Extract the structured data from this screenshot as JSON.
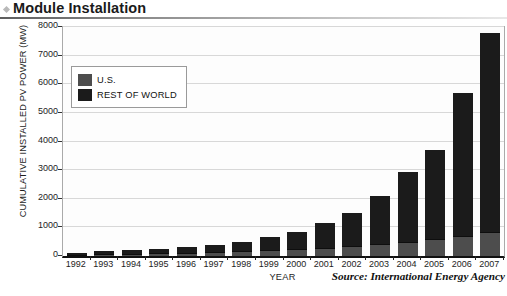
{
  "header": {
    "title": "Module Installation",
    "bullet_icon": "diamond-bullet-icon"
  },
  "chart_data": {
    "type": "bar",
    "subtype": "stacked-bar",
    "title": "Module Installation",
    "xlabel": "YEAR",
    "ylabel": "CUMULATIVE INSTALLED PV POWER (MW)",
    "ylim": [
      0,
      8000
    ],
    "ytick_step": 1000,
    "yticks": [
      0,
      1000,
      2000,
      3000,
      4000,
      5000,
      6000,
      7000,
      8000
    ],
    "ytick_labels": [
      "0",
      "1000",
      "2000",
      "3000",
      "4000",
      "5000",
      "6000",
      "7000",
      "8000"
    ],
    "grid": true,
    "grid_axis": "y",
    "categories": [
      "1992",
      "1993",
      "1994",
      "1995",
      "1996",
      "1997",
      "1998",
      "1999",
      "2000",
      "2001",
      "2002",
      "2003",
      "2004",
      "2005",
      "2006",
      "2007"
    ],
    "legend_position": "upper-left",
    "series": [
      {
        "name": "U.S.",
        "color": "#4d4d4d",
        "values": [
          45,
          60,
          75,
          90,
          110,
          135,
          165,
          200,
          240,
          290,
          350,
          420,
          500,
          590,
          700,
          830
        ]
      },
      {
        "name": "REST OF WORLD",
        "color": "#1b1b1b",
        "values": [
          65,
          100,
          125,
          160,
          210,
          265,
          335,
          450,
          610,
          860,
          1150,
          1680,
          2450,
          3110,
          5000,
          6970
        ]
      }
    ],
    "totals": [
      110,
      160,
      200,
      250,
      320,
      400,
      500,
      650,
      850,
      1150,
      1500,
      2100,
      2950,
      3700,
      5700,
      7800
    ],
    "annotations": {
      "source": "Source: International Energy Agency"
    }
  },
  "legend": {
    "items": [
      {
        "label": "U.S.",
        "swatch": "legend-swatch-us"
      },
      {
        "label": "REST OF WORLD",
        "swatch": "legend-swatch-rest-of-world"
      }
    ]
  }
}
